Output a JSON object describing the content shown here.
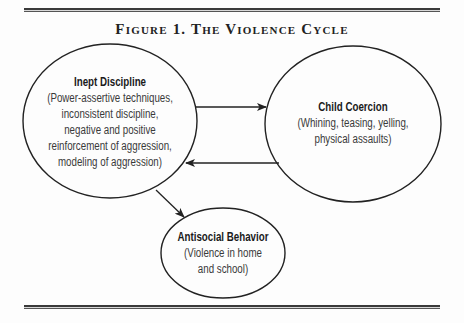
{
  "figure": {
    "title": "Figure 1. The Violence Cycle"
  },
  "nodes": {
    "inept_discipline": {
      "heading": "Inept Discipline",
      "lines": [
        "(Power-assertive techniques,",
        "inconsistent discipline,",
        "negative and positive",
        "reinforcement of aggression,",
        "modeling of aggression)"
      ]
    },
    "child_coercion": {
      "heading": "Child Coercion",
      "lines": [
        "(Whining, teasing, yelling,",
        "physical assaults)"
      ]
    },
    "antisocial_behavior": {
      "heading": "Antisocial Behavior",
      "lines": [
        "(Violence in home",
        "and school)"
      ]
    }
  },
  "edges": [
    {
      "from": "Inept Discipline",
      "to": "Child Coercion"
    },
    {
      "from": "Child Coercion",
      "to": "Inept Discipline"
    },
    {
      "from": "Inept Discipline",
      "to": "Antisocial Behavior"
    }
  ],
  "colors": {
    "stroke": "#222222",
    "text": "#3a3a3a",
    "background": "#fdfdfd"
  }
}
